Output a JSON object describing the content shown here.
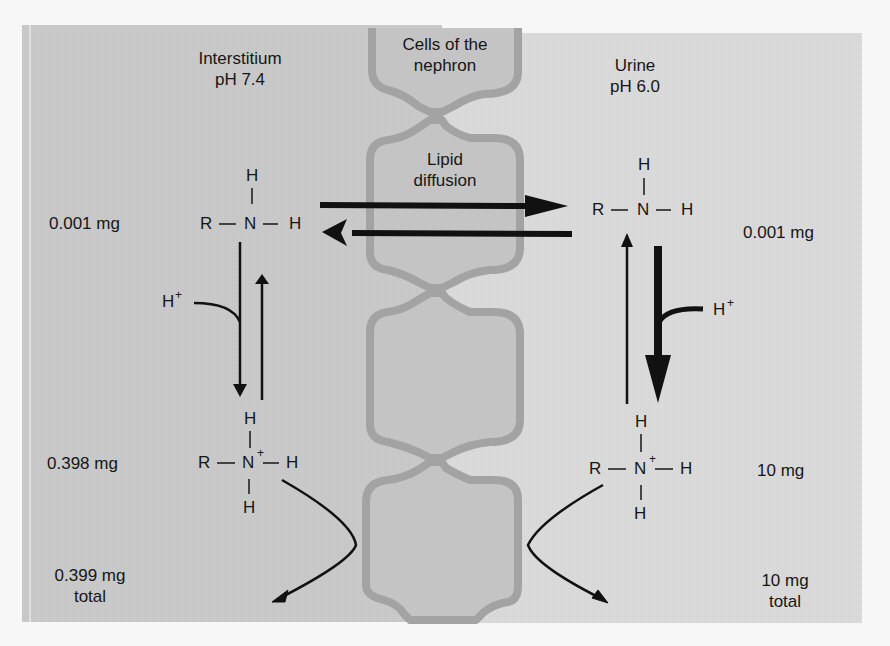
{
  "figure": {
    "colors": {
      "page_background": "#f7f7f7",
      "interstitium_panel": "#c9c9c9",
      "urine_panel": "#dadada",
      "cell_fill": "#c4c4c4",
      "cell_outline": "#a3a3a3",
      "ink": "#161616"
    }
  },
  "compartments": {
    "interstitium": {
      "name": "Interstitium",
      "ph": "pH 7.4"
    },
    "nephron": {
      "label_line1": "Cells of the",
      "label_line2": "nephron",
      "membrane_line1": "Lipid",
      "membrane_line2": "diffusion"
    },
    "urine": {
      "name": "Urine",
      "ph": "pH 6.0"
    }
  },
  "interstitium_side": {
    "unionized": {
      "amount": "0.001 mg",
      "structure": {
        "R": "R",
        "N": "N",
        "H_top": "H",
        "H_right": "H"
      }
    },
    "proton": "H",
    "proton_sup": "+",
    "ionized": {
      "amount": "0.398 mg",
      "structure": {
        "R": "R",
        "N": "N",
        "N_charge": "+",
        "H_top": "H",
        "H_right": "H",
        "H_bottom": "H"
      }
    },
    "total": {
      "amount": "0.399 mg",
      "label": "total"
    }
  },
  "urine_side": {
    "unionized": {
      "amount": "0.001 mg",
      "structure": {
        "R": "R",
        "N": "N",
        "H_top": "H",
        "H_right": "H"
      }
    },
    "proton": "H",
    "proton_sup": "+",
    "ionized": {
      "amount": "10 mg",
      "structure": {
        "R": "R",
        "N": "N",
        "N_charge": "+",
        "H_top": "H",
        "H_right": "H",
        "H_bottom": "H"
      }
    },
    "total": {
      "amount": "10 mg",
      "label": "total"
    }
  },
  "arrows": [
    {
      "id": "diffusion-to-urine",
      "from": "interstitium unionized",
      "to": "urine unionized",
      "weight": "thick"
    },
    {
      "id": "diffusion-to-interstitium",
      "from": "urine unionized",
      "to": "interstitium unionized",
      "weight": "thick"
    },
    {
      "id": "interstitium-protonation",
      "direction": "down",
      "weight": "thin"
    },
    {
      "id": "interstitium-deprotonation",
      "direction": "up",
      "weight": "thin"
    },
    {
      "id": "urine-protonation",
      "direction": "down",
      "weight": "bold"
    },
    {
      "id": "urine-deprotonation",
      "direction": "up",
      "weight": "thin"
    },
    {
      "id": "interstitium-ionized-to-total",
      "shape": "curved"
    },
    {
      "id": "urine-ionized-to-total",
      "shape": "curved"
    }
  ]
}
